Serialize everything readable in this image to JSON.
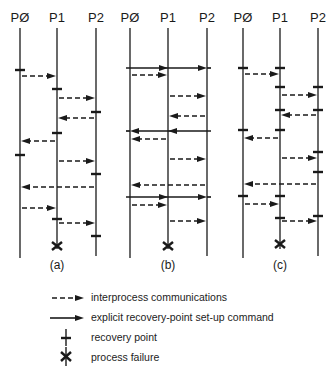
{
  "figure": {
    "process_labels": [
      "PØ",
      "P1",
      "P2"
    ],
    "panels": [
      {
        "id": "a",
        "label": "(a)",
        "lines_x": [
          20,
          57,
          96
        ],
        "recovery_points": [
          {
            "p": 0,
            "y": 70
          },
          {
            "p": 1,
            "y": 89
          },
          {
            "p": 2,
            "y": 112
          },
          {
            "p": 1,
            "y": 133
          },
          {
            "p": 0,
            "y": 155
          },
          {
            "p": 2,
            "y": 174
          },
          {
            "p": 1,
            "y": 219
          },
          {
            "p": 2,
            "y": 236
          }
        ],
        "messages": [
          {
            "from": 0,
            "to": 1,
            "y": 76,
            "type": "dashed"
          },
          {
            "from": 1,
            "to": 2,
            "y": 98,
            "type": "dashed"
          },
          {
            "from": 2,
            "to": 1,
            "y": 118,
            "type": "dashed"
          },
          {
            "from": 1,
            "to": 0,
            "y": 141,
            "type": "dashed"
          },
          {
            "from": 1,
            "to": 2,
            "y": 161,
            "type": "dashed"
          },
          {
            "from": 2,
            "to": 0,
            "y": 187,
            "type": "dashed"
          },
          {
            "from": 0,
            "to": 1,
            "y": 208,
            "type": "dashed"
          },
          {
            "from": 1,
            "to": 2,
            "y": 223,
            "type": "dashed"
          }
        ],
        "failure": {
          "p": 1,
          "y": 246
        }
      },
      {
        "id": "b",
        "label": "(b)",
        "lines_x": [
          130,
          168,
          207
        ],
        "recovery_points": [],
        "messages": [
          {
            "from": 0,
            "to": 2,
            "y": 68,
            "type": "solid"
          },
          {
            "from": 0,
            "to": 1,
            "y": 75,
            "type": "dashed"
          },
          {
            "from": 1,
            "to": 2,
            "y": 96,
            "type": "dashed"
          },
          {
            "from": 2,
            "to": 1,
            "y": 116,
            "type": "dashed"
          },
          {
            "from": 2,
            "to": 0,
            "y": 131,
            "type": "solid"
          },
          {
            "from": 1,
            "to": 0,
            "y": 139,
            "type": "dashed"
          },
          {
            "from": 1,
            "to": 2,
            "y": 159,
            "type": "dashed"
          },
          {
            "from": 2,
            "to": 0,
            "y": 185,
            "type": "dashed"
          },
          {
            "from": 0,
            "to": 2,
            "y": 197,
            "type": "solid"
          },
          {
            "from": 0,
            "to": 1,
            "y": 205,
            "type": "dashed"
          },
          {
            "from": 1,
            "to": 2,
            "y": 221,
            "type": "dashed"
          }
        ],
        "failure": {
          "p": 1,
          "y": 246
        }
      },
      {
        "id": "c",
        "label": "(c)",
        "lines_x": [
          243,
          280,
          318
        ],
        "recovery_points": [
          {
            "p": 0,
            "y": 68
          },
          {
            "p": 1,
            "y": 68
          },
          {
            "p": 1,
            "y": 87
          },
          {
            "p": 2,
            "y": 87
          },
          {
            "p": 1,
            "y": 110
          },
          {
            "p": 2,
            "y": 110
          },
          {
            "p": 0,
            "y": 130
          },
          {
            "p": 1,
            "y": 130
          },
          {
            "p": 2,
            "y": 152
          },
          {
            "p": 2,
            "y": 172
          },
          {
            "p": 0,
            "y": 196
          },
          {
            "p": 1,
            "y": 196
          },
          {
            "p": 1,
            "y": 218
          },
          {
            "p": 2,
            "y": 216
          }
        ],
        "messages": [
          {
            "from": 0,
            "to": 1,
            "y": 74,
            "type": "dashed"
          },
          {
            "from": 1,
            "to": 2,
            "y": 95,
            "type": "dashed"
          },
          {
            "from": 2,
            "to": 1,
            "y": 115,
            "type": "dashed"
          },
          {
            "from": 1,
            "to": 0,
            "y": 138,
            "type": "dashed"
          },
          {
            "from": 1,
            "to": 2,
            "y": 158,
            "type": "dashed"
          },
          {
            "from": 2,
            "to": 0,
            "y": 184,
            "type": "dashed"
          },
          {
            "from": 0,
            "to": 1,
            "y": 204,
            "type": "dashed"
          },
          {
            "from": 1,
            "to": 2,
            "y": 221,
            "type": "dashed"
          }
        ],
        "failure": {
          "p": 1,
          "y": 244
        }
      }
    ]
  },
  "legend": {
    "items": [
      {
        "symbol": "dashed-arrow",
        "label": "interprocess communications"
      },
      {
        "symbol": "solid-arrow",
        "label": "explicit recovery-point set-up command"
      },
      {
        "symbol": "recovery-point",
        "label": "recovery point"
      },
      {
        "symbol": "process-failure",
        "label": "process failure"
      }
    ]
  }
}
